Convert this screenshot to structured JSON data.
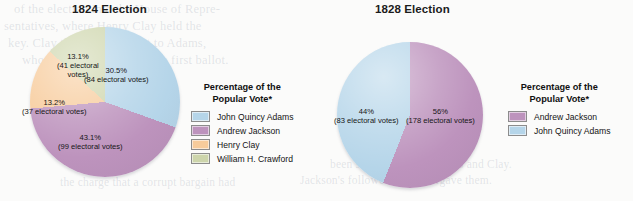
{
  "background": {
    "page_tint": "#fbfbfa",
    "bleed_lines": [
      "of the election into the House of Repre-",
      "sentatives, where Henry Clay held the",
      "key. Clay threw his support to Adams,",
      "who was then chosen on the first ballot."
    ],
    "bleed_lines_bottom": [
      "the charge that a corrupt bargain had",
      "been struck between Adams and Clay.",
      "Jackson's followers never forgave them."
    ]
  },
  "charts": [
    {
      "id": "election-1824",
      "title": "1824 Election",
      "legend_title_line1": "Percentage of the",
      "legend_title_line2": "Popular Vote*",
      "slices": [
        {
          "name": "John Quincy Adams",
          "percent": 30.5,
          "percent_label": "30.5%",
          "electoral_votes": 84,
          "votes_label": "(84 electoral votes)",
          "color": "#b5d5e9",
          "label_lines": [
            "30.5%",
            "(84 electoral votes)"
          ],
          "label_x": 84,
          "label_y": 66
        },
        {
          "name": "Andrew Jackson",
          "percent": 43.1,
          "percent_label": "43.1%",
          "electoral_votes": 99,
          "votes_label": "(99 electoral votes)",
          "color": "#bd93bd",
          "label_lines": [
            "43.1%",
            "(99 electoral votes)"
          ],
          "label_x": 58,
          "label_y": 133
        },
        {
          "name": "Henry Clay",
          "percent": 13.2,
          "percent_label": "13.2%",
          "electoral_votes": 37,
          "votes_label": "(37 electoral votes)",
          "color": "#f7cb9b",
          "label_lines": [
            "13.2%",
            "(37 electoral votes)"
          ],
          "label_x": 22,
          "label_y": 98
        },
        {
          "name": "William H. Crawford",
          "percent": 13.1,
          "percent_label": "13.1%",
          "electoral_votes": 41,
          "votes_label": "(41 electoral votes)",
          "color": "#cdd5ab",
          "label_lines": [
            "13.1%",
            "(41 electoral",
            "votes)"
          ],
          "label_x": 57,
          "label_y": 52
        }
      ]
    },
    {
      "id": "election-1828",
      "title": "1828 Election",
      "legend_title_line1": "Percentage of the",
      "legend_title_line2": "Popular Vote*",
      "slices": [
        {
          "name": "Andrew Jackson",
          "percent": 56,
          "percent_label": "56%",
          "electoral_votes": 178,
          "votes_label": "(178 electoral votes)",
          "color": "#bd93bd",
          "label_lines": [
            "56%",
            "(178 electoral votes)"
          ],
          "label_x": 406,
          "label_y": 107
        },
        {
          "name": "John Quincy Adams",
          "percent": 44,
          "percent_label": "44%",
          "electoral_votes": 83,
          "votes_label": "(83 electoral votes)",
          "color": "#b5d5e9",
          "label_lines": [
            "44%",
            "(83 electoral votes)"
          ],
          "label_x": 334,
          "label_y": 107
        }
      ]
    }
  ],
  "chart_data": [
    {
      "type": "pie",
      "title": "1824 Election",
      "legend_title": "Percentage of the Popular Vote*",
      "legend_position": "right",
      "unit": "percent of popular vote",
      "start_angle_deg": 0,
      "direction": "clockwise",
      "categories": [
        "John Quincy Adams",
        "Andrew Jackson",
        "Henry Clay",
        "William H. Crawford"
      ],
      "values": [
        30.5,
        43.1,
        13.2,
        13.1
      ],
      "electoral_votes": [
        84,
        99,
        37,
        41
      ],
      "colors": [
        "#b5d5e9",
        "#bd93bd",
        "#f7cb9b",
        "#cdd5ab"
      ],
      "data_labels": [
        "30.5% (84 electoral votes)",
        "43.1% (99 electoral votes)",
        "13.2% (37 electoral votes)",
        "13.1% (41 electoral votes)"
      ],
      "xlabel": "",
      "ylabel": "",
      "grid": false
    },
    {
      "type": "pie",
      "title": "1828 Election",
      "legend_title": "Percentage of the Popular Vote*",
      "legend_position": "right",
      "unit": "percent of popular vote",
      "start_angle_deg": 0,
      "direction": "clockwise",
      "categories": [
        "Andrew Jackson",
        "John Quincy Adams"
      ],
      "values": [
        56,
        44
      ],
      "electoral_votes": [
        178,
        83
      ],
      "colors": [
        "#bd93bd",
        "#b5d5e9"
      ],
      "data_labels": [
        "56% (178 electoral votes)",
        "44% (83 electoral votes)"
      ],
      "xlabel": "",
      "ylabel": "",
      "grid": false
    }
  ]
}
